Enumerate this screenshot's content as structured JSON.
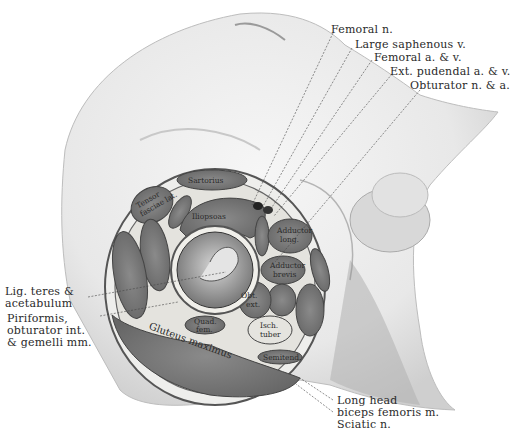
{
  "figure": {
    "type": "anatomical cross-section illustration"
  },
  "callouts_top_right": [
    "Femoral n.",
    "Large saphenous v.",
    "Femoral a. & v.",
    "Ext. pudendal a. & v.",
    "Obturator n. & a."
  ],
  "callouts_left": {
    "lig_teres": [
      "Lig. teres &",
      "acetabulum"
    ],
    "piriformis": [
      "Piriformis,",
      "obturator int.",
      "& gemelli mm."
    ]
  },
  "callouts_bottom": [
    "Long head",
    "biceps femoris m.",
    "Sciatic n."
  ],
  "muscle_labels": {
    "sartorius": "Sartorius",
    "tensor": [
      "Tensor",
      "fasciae lat."
    ],
    "rectus": "Rectus",
    "iliopsoas": "Iliopsoas",
    "pectineus": "Pectin.",
    "adductor_longus": [
      "Adductor",
      "long."
    ],
    "adductor_brevis": [
      "Adductor",
      "brevis"
    ],
    "gracilis": "Gracilis",
    "gluteus_minimus": "Gluteus min.",
    "gluteus_medius": "Gluteus med.",
    "obt_ext": [
      "Obt.",
      "ext."
    ],
    "adductor_minimus": [
      "Adductor",
      "min."
    ],
    "adductor_magnus": [
      "Adductor",
      "magnus"
    ],
    "quad_fem": [
      "Quad.",
      "fem."
    ],
    "isch_tuber": [
      "Isch.",
      "tuber"
    ],
    "semitend": "Semitend.",
    "gluteus_maximus": "Gluteus maximus"
  }
}
